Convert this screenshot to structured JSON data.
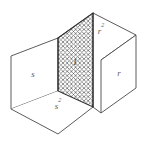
{
  "figure": {
    "type": "geometric-diagram",
    "faces": {
      "top": {
        "label": "r",
        "exponent": "2",
        "name": "top-face"
      },
      "left": {
        "label": "s",
        "exponent": "",
        "name": "left-face"
      },
      "right": {
        "label": "r",
        "exponent": "",
        "name": "right-face"
      },
      "bottom": {
        "label": "s",
        "exponent": "2",
        "name": "bottom-face"
      },
      "center": {
        "label": "1",
        "exponent": "",
        "name": "center-hatched-square"
      }
    },
    "colors": {
      "stroke": "#4a4a4a",
      "stroke_dark": "#303030",
      "label": "#5a5a5a",
      "center_label": "#3a3a3a",
      "background": "#ffffff",
      "hatch": "#6b6b6b"
    },
    "geometry": {
      "width": 148,
      "height": 146,
      "top_apex": [
        93,
        13
      ],
      "left_back": [
        11,
        56
      ],
      "left_front_bottom": [
        11,
        109
      ],
      "right_top": [
        136,
        35
      ],
      "right_bottom": [
        136,
        88
      ],
      "bottom_apex": [
        58,
        134
      ],
      "hatch_top_left": [
        58,
        38
      ],
      "hatch_top_right": [
        93,
        13
      ],
      "hatch_bottom_right": [
        93,
        107
      ],
      "hatch_bottom_left": [
        58,
        91
      ]
    }
  }
}
